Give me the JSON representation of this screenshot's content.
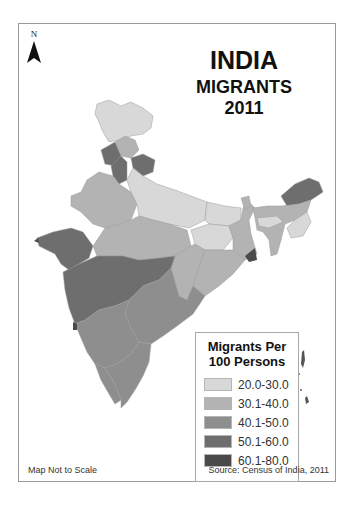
{
  "north_arrow": {
    "label": "N"
  },
  "title": {
    "line1": "INDIA",
    "line2": "MIGRANTS",
    "line3": "2011"
  },
  "legend": {
    "title_line1": "Migrants Per",
    "title_line2": "100 Persons",
    "classes": [
      {
        "label": "20.0-30.0",
        "color": "#d8d8d8"
      },
      {
        "label": "30.1-40.0",
        "color": "#b3b3b3"
      },
      {
        "label": "40.1-50.0",
        "color": "#8e8e8e"
      },
      {
        "label": "50.1-60.0",
        "color": "#6e6e6e"
      },
      {
        "label": "60.1-80.0",
        "color": "#4a4a4a"
      }
    ]
  },
  "footer": {
    "scale_note": "Map Not to Scale",
    "source": "Source: Census of India, 2011"
  },
  "regions": [
    {
      "name": "Jammu & Kashmir",
      "class": "20.0-30.0"
    },
    {
      "name": "Himachal Pradesh",
      "class": "30.1-40.0"
    },
    {
      "name": "Punjab",
      "class": "50.1-60.0"
    },
    {
      "name": "Haryana",
      "class": "50.1-60.0"
    },
    {
      "name": "Uttarakhand",
      "class": "50.1-60.0"
    },
    {
      "name": "Rajasthan",
      "class": "30.1-40.0"
    },
    {
      "name": "Uttar Pradesh",
      "class": "20.0-30.0"
    },
    {
      "name": "Bihar",
      "class": "20.0-30.0"
    },
    {
      "name": "Gujarat",
      "class": "50.1-60.0"
    },
    {
      "name": "Madhya Pradesh",
      "class": "30.1-40.0"
    },
    {
      "name": "Jharkhand",
      "class": "20.0-30.0"
    },
    {
      "name": "West Bengal",
      "class": "30.1-40.0"
    },
    {
      "name": "Chhattisgarh",
      "class": "30.1-40.0"
    },
    {
      "name": "Odisha",
      "class": "30.1-40.0"
    },
    {
      "name": "Maharashtra",
      "class": "50.1-60.0"
    },
    {
      "name": "Andhra Pradesh",
      "class": "40.1-50.0"
    },
    {
      "name": "Karnataka",
      "class": "40.1-50.0"
    },
    {
      "name": "Goa",
      "class": "60.1-80.0"
    },
    {
      "name": "Kerala",
      "class": "40.1-50.0"
    },
    {
      "name": "Tamil Nadu",
      "class": "40.1-50.0"
    },
    {
      "name": "Sikkim",
      "class": "30.1-40.0"
    },
    {
      "name": "Arunachal Pradesh",
      "class": "50.1-60.0"
    },
    {
      "name": "Assam",
      "class": "30.1-40.0"
    },
    {
      "name": "Meghalaya",
      "class": "20.0-30.0"
    },
    {
      "name": "Nagaland",
      "class": "20.0-30.0"
    },
    {
      "name": "Tripura/Mizoram",
      "class": "30.1-40.0"
    }
  ]
}
